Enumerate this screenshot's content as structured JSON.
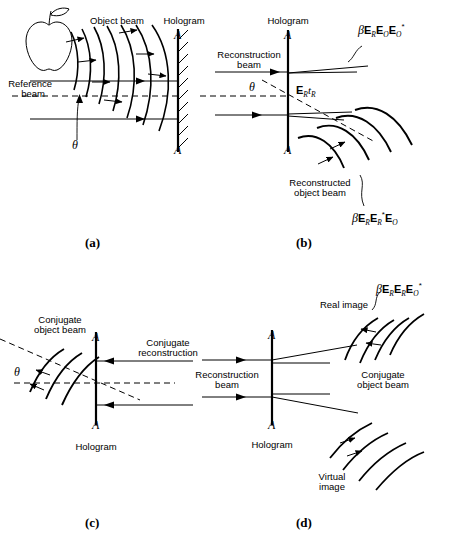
{
  "figure": {
    "type": "holography-diagram",
    "panels": [
      {
        "id": "a",
        "label": "(a)",
        "title_labels": {
          "object_beam": "Object beam",
          "hologram": "Hologram",
          "reference_beam": "Reference\nbeam"
        },
        "plate_top_label": "A",
        "plate_bottom_label": "A",
        "angle_label": "θ",
        "object": "apple"
      },
      {
        "id": "b",
        "label": "(b)",
        "title_labels": {
          "hologram": "Hologram",
          "reconstruction_beam": "Reconstruction\nbeam",
          "reconstructed_object_beam": "Reconstructed\nobject beam"
        },
        "plate_top_label": "A",
        "plate_bottom_label": "A",
        "angle_label": "θ",
        "transmittance_label": {
          "beta": "",
          "terms": "E_R t_R"
        },
        "equation_top": {
          "beta": "β",
          "terms": [
            {
              "sym": "E",
              "sub": "R",
              "star": false
            },
            {
              "sym": "E",
              "sub": "O",
              "star": false
            },
            {
              "sym": "E",
              "sub": "O",
              "star": true
            }
          ]
        },
        "equation_bottom": {
          "beta": "β",
          "terms": [
            {
              "sym": "E",
              "sub": "R",
              "star": false
            },
            {
              "sym": "E",
              "sub": "R",
              "star": true
            },
            {
              "sym": "E",
              "sub": "O",
              "star": false
            }
          ]
        }
      },
      {
        "id": "c",
        "label": "(c)",
        "title_labels": {
          "conjugate_object_beam": "Conjugate\nobject beam",
          "conjugate_reconstruction": "Conjugate\nreconstruction",
          "hologram": "Hologram"
        },
        "plate_top_label": "A",
        "plate_bottom_label": "A",
        "angle_label": "θ"
      },
      {
        "id": "d",
        "label": "(d)",
        "title_labels": {
          "reconstruction_beam": "Reconstruction\nbeam",
          "real_image": "Real image",
          "conjugate_object_beam": "Conjugate\nobject beam",
          "hologram": "Hologram",
          "virtual_image": "Virtual\nimage"
        },
        "plate_top_label": "A",
        "plate_bottom_label": "A",
        "equation_top": {
          "beta": "β",
          "terms": [
            {
              "sym": "E",
              "sub": "R",
              "star": false
            },
            {
              "sym": "E",
              "sub": "R",
              "star": false
            },
            {
              "sym": "E",
              "sub": "O",
              "star": true
            }
          ]
        }
      }
    ],
    "colors": {
      "ink": "#000000",
      "background": "#ffffff"
    }
  },
  "text": {
    "object_beam": "Object beam",
    "hologram": "Hologram",
    "reference_beam_l1": "Reference",
    "reference_beam_l2": "beam",
    "reconstruction_beam_l1": "Reconstruction",
    "reconstruction_beam_l2": "beam",
    "reconstructed_l1": "Reconstructed",
    "reconstructed_l2": "object beam",
    "conjugate_l1": "Conjugate",
    "conjugate_object_l2": "object beam",
    "conjugate_recon_l2": "reconstruction",
    "real_image": "Real image",
    "virtual_l1": "Virtual",
    "virtual_l2": "image",
    "A": "A",
    "theta": "θ",
    "panel_a": "(a)",
    "panel_b": "(b)",
    "panel_c": "(c)",
    "panel_d": "(d)"
  }
}
